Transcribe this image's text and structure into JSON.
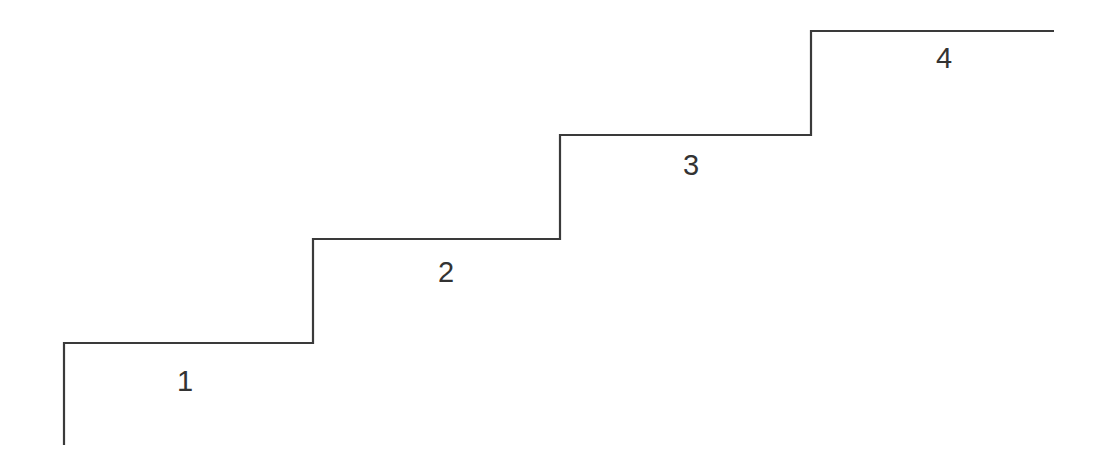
{
  "diagram": {
    "type": "staircase",
    "line_color": "#3a3a3a",
    "background": "#ffffff",
    "path_points": [
      [
        64,
        445
      ],
      [
        64,
        343
      ],
      [
        313,
        343
      ],
      [
        313,
        239
      ],
      [
        560,
        239
      ],
      [
        560,
        135
      ],
      [
        811,
        135
      ],
      [
        811,
        31
      ],
      [
        1054,
        31
      ]
    ],
    "steps": [
      {
        "label": "1",
        "x": 185,
        "y": 381
      },
      {
        "label": "2",
        "x": 446,
        "y": 272
      },
      {
        "label": "3",
        "x": 691,
        "y": 165
      },
      {
        "label": "4",
        "x": 944,
        "y": 58
      }
    ]
  }
}
